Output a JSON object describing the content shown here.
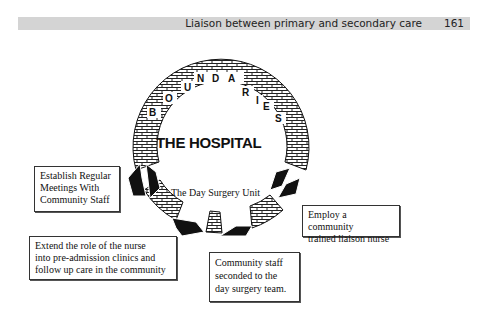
{
  "header": {
    "title": "Liaison between primary and secondary care",
    "page_number": "161"
  },
  "diagram": {
    "ring_label_letters": [
      "B",
      "O",
      "U",
      "N",
      "D",
      "A",
      "R",
      "I",
      "E",
      "S"
    ],
    "ring_label": "BOUNDARIES",
    "center_title": "THE HOSPITAL",
    "center_subtitle": "The Day Surgery Unit",
    "boxes": {
      "meetings": [
        "Establish Regular",
        "Meetings With",
        "Community Staff"
      ],
      "extend_role": [
        "Extend the role of the nurse",
        "into pre-admission clinics and",
        "follow up care in the community"
      ],
      "seconded": [
        "Community staff",
        "seconded to the",
        "day surgery team."
      ],
      "liaison_nurse": [
        "Employ a community",
        "trained liaison nurse"
      ]
    },
    "colors": {
      "header_bar": "#d4d4d4",
      "ink": "#111111",
      "background": "#ffffff"
    }
  }
}
